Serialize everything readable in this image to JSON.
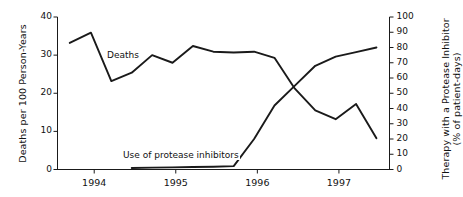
{
  "chart_data": {
    "type": "line",
    "title": "",
    "xlabel": "",
    "x_tick_labels": [
      "1994",
      "1995",
      "1996",
      "1997"
    ],
    "x_tick_values": [
      1994,
      1995,
      1996,
      1997
    ],
    "xlim": [
      1993.55,
      1997.62
    ],
    "grid": false,
    "legend_position": "inline-annotations",
    "axes": [
      {
        "id": "left",
        "ylabel": "Deaths per 100 Person-Years",
        "ylim": [
          0,
          40
        ],
        "yticks": [
          0,
          10,
          20,
          30,
          40
        ],
        "ytick_labels": [
          "0",
          "10",
          "20",
          "30",
          "40"
        ]
      },
      {
        "id": "right",
        "ylabel": "Therapy with a Protease Inhibitor",
        "ylabel_line2": "(% of patient-days)",
        "ylim": [
          0,
          100
        ],
        "yticks": [
          0,
          10,
          20,
          30,
          40,
          50,
          60,
          70,
          80,
          90,
          100
        ],
        "ytick_labels": [
          "0",
          "10",
          "20",
          "30",
          "40",
          "50",
          "60",
          "70",
          "80",
          "90",
          "100"
        ]
      }
    ],
    "series": [
      {
        "name": "Deaths",
        "axis": "left",
        "units": "deaths per 100 person-years",
        "annotation": "Deaths",
        "x": [
          1993.7,
          1993.96,
          1994.21,
          1994.46,
          1994.71,
          1994.96,
          1995.21,
          1995.46,
          1995.71,
          1995.96,
          1996.21,
          1996.46,
          1996.71,
          1996.96,
          1997.21,
          1997.46
        ],
        "values": [
          33.2,
          35.9,
          23.2,
          25.4,
          30.0,
          28.0,
          32.4,
          30.9,
          30.7,
          30.9,
          29.3,
          21.2,
          15.5,
          13.2,
          17.2,
          8.2
        ]
      },
      {
        "name": "Use of protease inhibitors",
        "axis": "right",
        "units": "% of patient-days",
        "annotation": "Use of protease inhibitors",
        "x": [
          1994.46,
          1994.71,
          1994.96,
          1995.21,
          1995.46,
          1995.71,
          1995.96,
          1996.21,
          1996.46,
          1996.71,
          1996.96,
          1997.21,
          1997.46
        ],
        "values": [
          1.0,
          1.2,
          1.4,
          1.6,
          1.8,
          2.2,
          20.0,
          42.0,
          55.0,
          68.0,
          74.0,
          77.0,
          80.0
        ]
      }
    ],
    "annotations": [
      {
        "text": "Deaths",
        "x_px": 106,
        "y_px": 50
      },
      {
        "text": "Use of protease inhibitors",
        "x_px": 122,
        "y_px": 150
      }
    ]
  },
  "style": {
    "line_color": "#1a1a1a",
    "axis_color": "#1a1a1a",
    "background": "#ffffff"
  }
}
